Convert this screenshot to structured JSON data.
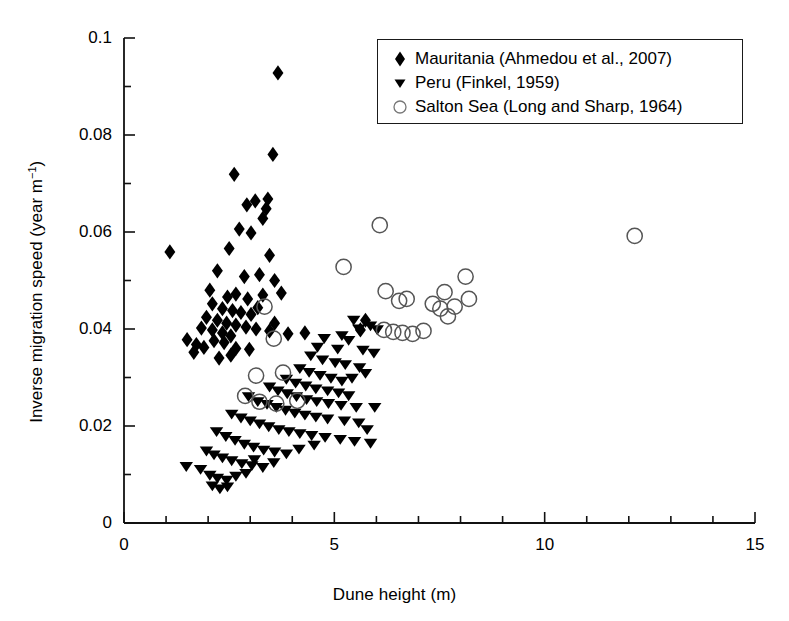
{
  "chart_data": {
    "type": "scatter",
    "title": "",
    "xlabel": "Dune height (m)",
    "ylabel_text": "Inverse migration speed (year m",
    "ylabel_sup": "−1",
    "ylabel_tail": ")",
    "ylabel_full": "Inverse migration speed (year m−1)",
    "xlim": [
      0,
      15
    ],
    "ylim": [
      0,
      0.1
    ],
    "xticks": [
      0,
      5,
      10,
      15
    ],
    "xtick_labels": [
      "0",
      "5",
      "10",
      "15"
    ],
    "xminor_step": 1,
    "yticks": [
      0,
      0.02,
      0.04,
      0.06,
      0.08,
      0.1
    ],
    "ytick_labels": [
      "0",
      "0.02",
      "0.04",
      "0.06",
      "0.08",
      "0.1"
    ],
    "yminor_step": 0.01,
    "grid": false,
    "legend_position": "top-right",
    "marker_color": "#000000",
    "open_marker_edge": "#555555",
    "series": [
      {
        "name": "Mauritania (Ahmedou et al., 2007)",
        "marker": "diamond",
        "fill": "#000000",
        "points": [
          [
            3.66,
            0.0928
          ],
          [
            2.62,
            0.0719
          ],
          [
            3.54,
            0.076
          ],
          [
            3.12,
            0.0664
          ],
          [
            3.42,
            0.0668
          ],
          [
            3.38,
            0.0648
          ],
          [
            3.3,
            0.0628
          ],
          [
            2.92,
            0.0656
          ],
          [
            2.74,
            0.0606
          ],
          [
            3.02,
            0.0598
          ],
          [
            3.46,
            0.0552
          ],
          [
            1.09,
            0.0559
          ],
          [
            2.5,
            0.0566
          ],
          [
            2.22,
            0.052
          ],
          [
            2.86,
            0.0508
          ],
          [
            3.22,
            0.0512
          ],
          [
            3.58,
            0.05
          ],
          [
            2.04,
            0.048
          ],
          [
            2.46,
            0.0466
          ],
          [
            2.66,
            0.0472
          ],
          [
            2.94,
            0.0462
          ],
          [
            3.3,
            0.047
          ],
          [
            3.74,
            0.0474
          ],
          [
            2.1,
            0.0452
          ],
          [
            2.34,
            0.0442
          ],
          [
            2.58,
            0.0438
          ],
          [
            2.78,
            0.0434
          ],
          [
            3.02,
            0.043
          ],
          [
            3.18,
            0.0444
          ],
          [
            1.96,
            0.0424
          ],
          [
            2.22,
            0.0418
          ],
          [
            2.44,
            0.0412
          ],
          [
            2.66,
            0.0408
          ],
          [
            2.9,
            0.0404
          ],
          [
            3.14,
            0.04
          ],
          [
            3.46,
            0.0396
          ],
          [
            1.84,
            0.0402
          ],
          [
            2.1,
            0.0398
          ],
          [
            2.34,
            0.0392
          ],
          [
            2.54,
            0.0386
          ],
          [
            1.5,
            0.0378
          ],
          [
            1.72,
            0.0368
          ],
          [
            1.9,
            0.0362
          ],
          [
            2.14,
            0.0376
          ],
          [
            2.38,
            0.0372
          ],
          [
            2.66,
            0.036
          ],
          [
            2.98,
            0.0358
          ],
          [
            3.58,
            0.0412
          ],
          [
            3.9,
            0.039
          ],
          [
            4.3,
            0.0392
          ],
          [
            5.62,
            0.0398
          ],
          [
            5.74,
            0.0418
          ],
          [
            2.26,
            0.034
          ],
          [
            2.54,
            0.0346
          ],
          [
            1.66,
            0.0352
          ]
        ]
      },
      {
        "name": "Peru (Finkel, 1959)",
        "marker": "triangle-down",
        "fill": "#000000",
        "points": [
          [
            5.46,
            0.0418
          ],
          [
            5.58,
            0.04
          ],
          [
            5.86,
            0.0406
          ],
          [
            6.02,
            0.0398
          ],
          [
            5.18,
            0.0386
          ],
          [
            5.34,
            0.0376
          ],
          [
            5.08,
            0.0358
          ],
          [
            4.76,
            0.038
          ],
          [
            4.6,
            0.0362
          ],
          [
            5.68,
            0.0356
          ],
          [
            5.94,
            0.035
          ],
          [
            4.44,
            0.0344
          ],
          [
            4.72,
            0.0336
          ],
          [
            5.02,
            0.033
          ],
          [
            5.26,
            0.0326
          ],
          [
            5.6,
            0.032
          ],
          [
            4.18,
            0.0318
          ],
          [
            4.4,
            0.031
          ],
          [
            4.66,
            0.0304
          ],
          [
            4.92,
            0.0298
          ],
          [
            5.18,
            0.0292
          ],
          [
            5.42,
            0.0298
          ],
          [
            5.74,
            0.0308
          ],
          [
            3.86,
            0.0296
          ],
          [
            4.08,
            0.0288
          ],
          [
            4.32,
            0.0282
          ],
          [
            4.56,
            0.0276
          ],
          [
            4.84,
            0.0272
          ],
          [
            5.1,
            0.0268
          ],
          [
            5.34,
            0.0262
          ],
          [
            3.46,
            0.028
          ],
          [
            3.66,
            0.0272
          ],
          [
            3.88,
            0.0266
          ],
          [
            4.1,
            0.026
          ],
          [
            4.34,
            0.0254
          ],
          [
            4.58,
            0.025
          ],
          [
            4.86,
            0.0246
          ],
          [
            5.16,
            0.0242
          ],
          [
            5.52,
            0.0238
          ],
          [
            2.96,
            0.026
          ],
          [
            3.18,
            0.025
          ],
          [
            3.4,
            0.0244
          ],
          [
            3.62,
            0.0238
          ],
          [
            3.84,
            0.0232
          ],
          [
            4.06,
            0.0226
          ],
          [
            4.3,
            0.0222
          ],
          [
            4.56,
            0.0218
          ],
          [
            4.84,
            0.0214
          ],
          [
            5.24,
            0.021
          ],
          [
            5.58,
            0.0206
          ],
          [
            2.56,
            0.0224
          ],
          [
            2.78,
            0.0216
          ],
          [
            3.0,
            0.021
          ],
          [
            3.22,
            0.0204
          ],
          [
            3.44,
            0.0198
          ],
          [
            3.68,
            0.0192
          ],
          [
            3.92,
            0.0188
          ],
          [
            4.18,
            0.0184
          ],
          [
            4.46,
            0.018
          ],
          [
            4.78,
            0.0176
          ],
          [
            5.14,
            0.0172
          ],
          [
            5.48,
            0.0168
          ],
          [
            2.2,
            0.0188
          ],
          [
            2.42,
            0.0178
          ],
          [
            2.64,
            0.017
          ],
          [
            2.86,
            0.0162
          ],
          [
            3.08,
            0.0156
          ],
          [
            3.32,
            0.015
          ],
          [
            3.58,
            0.0146
          ],
          [
            3.86,
            0.0142
          ],
          [
            4.16,
            0.0152
          ],
          [
            4.52,
            0.016
          ],
          [
            1.96,
            0.0148
          ],
          [
            2.14,
            0.014
          ],
          [
            2.34,
            0.0134
          ],
          [
            2.56,
            0.0128
          ],
          [
            2.8,
            0.0122
          ],
          [
            3.04,
            0.0118
          ],
          [
            3.3,
            0.0114
          ],
          [
            1.48,
            0.0116
          ],
          [
            1.82,
            0.011
          ],
          [
            2.04,
            0.0098
          ],
          [
            2.22,
            0.0092
          ],
          [
            2.44,
            0.0088
          ],
          [
            2.66,
            0.0096
          ],
          [
            2.9,
            0.0102
          ],
          [
            2.1,
            0.0076
          ],
          [
            2.28,
            0.007
          ],
          [
            2.46,
            0.0074
          ],
          [
            3.1,
            0.013
          ],
          [
            3.56,
            0.0124
          ],
          [
            5.96,
            0.0238
          ],
          [
            5.78,
            0.0192
          ],
          [
            5.86,
            0.0164
          ]
        ]
      },
      {
        "name": "Salton Sea (Long and Sharp, 1964)",
        "marker": "circle-open",
        "fill": "none",
        "points": [
          [
            6.08,
            0.0614
          ],
          [
            12.14,
            0.0592
          ],
          [
            5.22,
            0.0528
          ],
          [
            8.12,
            0.0508
          ],
          [
            6.22,
            0.0478
          ],
          [
            7.62,
            0.0476
          ],
          [
            6.54,
            0.0458
          ],
          [
            6.72,
            0.0462
          ],
          [
            8.2,
            0.0462
          ],
          [
            7.34,
            0.0452
          ],
          [
            7.52,
            0.0442
          ],
          [
            7.86,
            0.0446
          ],
          [
            7.7,
            0.0426
          ],
          [
            3.34,
            0.0446
          ],
          [
            6.18,
            0.0398
          ],
          [
            6.4,
            0.0394
          ],
          [
            6.62,
            0.0392
          ],
          [
            6.86,
            0.039
          ],
          [
            7.12,
            0.0396
          ],
          [
            3.56,
            0.038
          ],
          [
            3.14,
            0.0304
          ],
          [
            3.78,
            0.031
          ],
          [
            2.88,
            0.0262
          ],
          [
            3.22,
            0.025
          ],
          [
            3.62,
            0.0246
          ],
          [
            4.12,
            0.0252
          ]
        ]
      }
    ]
  },
  "legend": {
    "items": [
      {
        "marker": "diamond",
        "label": "Mauritania (Ahmedou et al., 2007)"
      },
      {
        "marker": "triangle-down",
        "label": "Peru (Finkel, 1959)"
      },
      {
        "marker": "circle-open",
        "label": "Salton Sea (Long and Sharp, 1964)"
      }
    ]
  }
}
